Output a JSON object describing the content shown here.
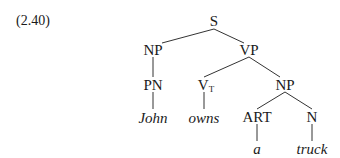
{
  "example_number": "(2.40)",
  "tree": {
    "S": "S",
    "NP_subject": "NP",
    "VP": "VP",
    "PN": "PN",
    "V_main": "V",
    "V_sub": "T",
    "NP_object": "NP",
    "ART": "ART",
    "N": "N",
    "words": {
      "john": "John",
      "owns": "owns",
      "a": "a",
      "truck": "truck"
    }
  },
  "colors": {
    "ink": "#1a1a1a",
    "background": "#ffffff"
  }
}
